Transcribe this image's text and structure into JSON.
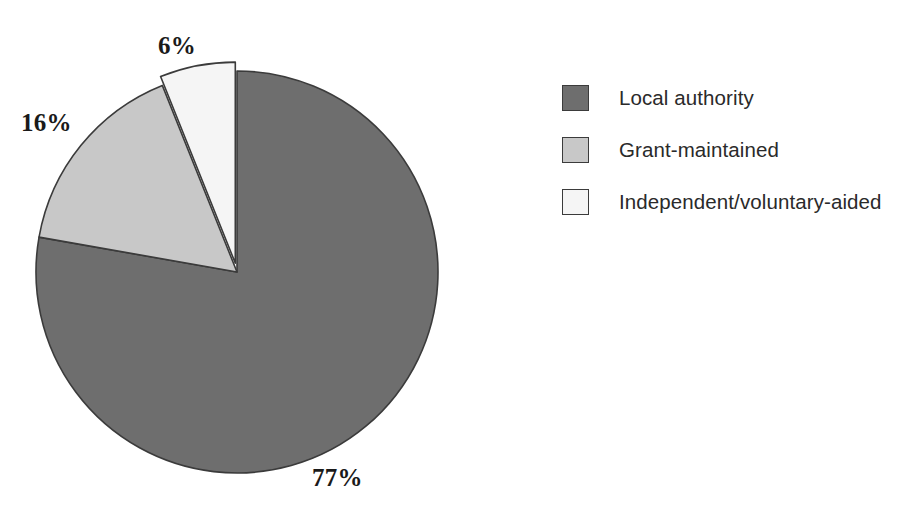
{
  "chart_data": {
    "type": "pie",
    "title": "",
    "categories": [
      "Local authority",
      "Grant-maintained",
      "Independent/voluntary-aided"
    ],
    "values": [
      77,
      16,
      6
    ],
    "value_labels": [
      "77%",
      "16%",
      "6%"
    ],
    "units": "percent",
    "start_angle_deg": 0,
    "direction": "clockwise",
    "exploded_slices": [
      "Independent/voluntary-aided"
    ],
    "legend_position": "right",
    "grid": false,
    "colors": [
      "#6e6e6e",
      "#c8c8c8",
      "#f5f5f5"
    ],
    "outline_color": "#3b3b3b",
    "background": "#ffffff"
  },
  "labels": {
    "top": "6%",
    "left": "16%",
    "bottom": "77%"
  },
  "legend": {
    "items": [
      {
        "label": "Local authority",
        "color": "#6e6e6e"
      },
      {
        "label": "Grant-maintained",
        "color": "#c8c8c8"
      },
      {
        "label": "Independent/voluntary-aided",
        "color": "#f5f5f5"
      }
    ]
  }
}
